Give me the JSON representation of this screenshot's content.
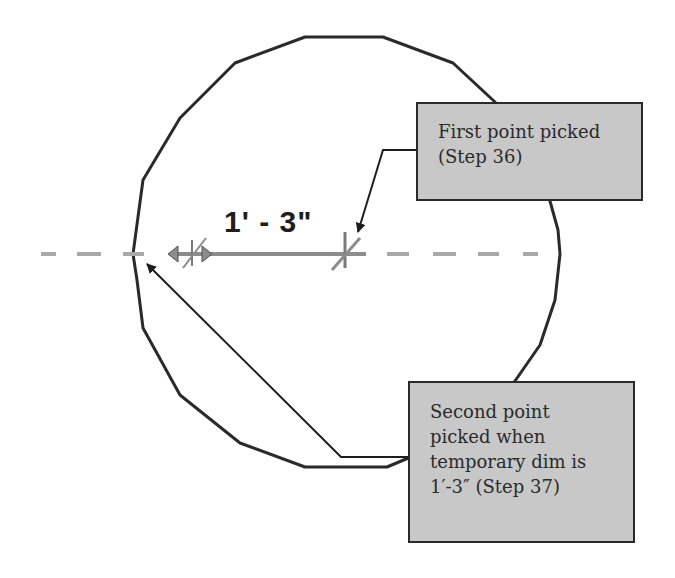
{
  "diagram": {
    "dimension_label": "1' - 3\"",
    "callouts": [
      {
        "id": "first",
        "text": "First point picked\n(Step 36)"
      },
      {
        "id": "second",
        "text": "Second point\npicked when\ntemporary dim is\n1′-3″ (Step 37)"
      }
    ],
    "colors": {
      "outline": "#2a2a2a",
      "callout_fill": "#c8c8c8",
      "centerline": "#a8a8a8",
      "dimension_line": "#8c8c8c",
      "background": "#ffffff"
    },
    "shapes": {
      "circle_polygon": "305,37 383,37 453,63 495,102 540,165 558,230 560,254 555,300 540,345 515,381 475,430 387,467 305,467 240,443 180,395 143,328 137,280 133,254 143,180 180,118 235,63",
      "centerline_dashes": [
        [
          41,
          56
        ],
        [
          77,
          101
        ],
        [
          123,
          144
        ],
        [
          387,
          409
        ],
        [
          433,
          456
        ],
        [
          478,
          499
        ],
        [
          523,
          538
        ]
      ],
      "centerline_y": 254
    }
  }
}
